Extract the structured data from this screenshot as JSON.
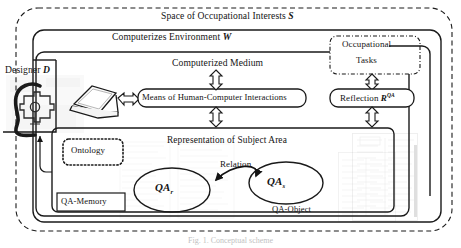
{
  "figure": {
    "title": "Space of Occupational Interests S",
    "caption": "Fig. 1. Conceptual scheme"
  },
  "outer": {
    "space_label_text": "Space of Occupational Interests",
    "space_label_symbol": "S",
    "border_style": "dashed"
  },
  "environment": {
    "label_text": "Computerizes Environment",
    "label_symbol": "W",
    "border_style": "solid-rounded"
  },
  "designer": {
    "label_text": "Designer",
    "label_symbol": "D",
    "icons": [
      "head-gear-icon",
      "laptop-icon"
    ]
  },
  "medium": {
    "label": "Computerized Medium"
  },
  "occupational_tasks": {
    "line1": "Occupational",
    "line2": "Tasks",
    "border_style": "dash-dot-rounded"
  },
  "means_box": {
    "label": "Means of Human-Computer Interactions",
    "border_style": "solid-rounded"
  },
  "reflection_box": {
    "label_text": "Reflection",
    "label_symbol": "R",
    "label_superscript": "QA",
    "border_style": "solid-rounded"
  },
  "subject_area": {
    "label": "Representation of Subject Area"
  },
  "ontology": {
    "label": "Ontology",
    "border_style": "dotted-rounded"
  },
  "qa_memory": {
    "label": "QA-Memory",
    "border_style": "solid-rect"
  },
  "relation": {
    "label": "Relation",
    "arrow": "double-headed-curved"
  },
  "node_left": {
    "label_base": "QA",
    "label_subscript": "r",
    "shape": "ellipse"
  },
  "node_right": {
    "label_base": "QA",
    "label_subscript": "s",
    "shape": "ellipse",
    "caption": "QA-Object"
  },
  "colors": {
    "ink": "#141414",
    "line": "#1a1a1a",
    "watermark": "#9a9a9a",
    "background": "#ffffff"
  },
  "arrows": {
    "hollow_count": 6,
    "hollow_style": "double-headed-block-arrow"
  }
}
